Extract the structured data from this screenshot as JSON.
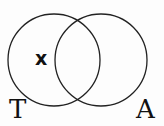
{
  "diagram": {
    "type": "venn",
    "sets": [
      {
        "name": "T",
        "label": "T"
      },
      {
        "name": "A",
        "label": "A"
      }
    ],
    "marker": {
      "text": "x",
      "region": "T only"
    },
    "colors": {
      "stroke": "#222222",
      "background": "#fdfdfd"
    }
  }
}
